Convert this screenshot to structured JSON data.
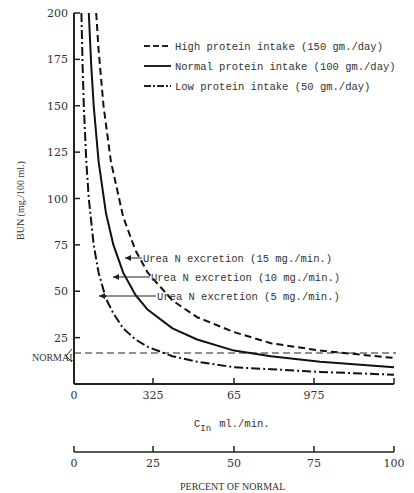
{
  "chart_data": {
    "type": "line",
    "title": "",
    "xlabel": "C_In ml./min.",
    "xlabel_main": "C",
    "xlabel_sub": "In",
    "xlabel_unit": "ml./min.",
    "x2label": "PERCENT OF NORMAL",
    "ylabel": "BUN (mg./100 ml.)",
    "ylim": [
      0,
      200
    ],
    "xlim": [
      0,
      130
    ],
    "yticks": [
      25,
      50,
      75,
      100,
      125,
      150,
      175,
      200
    ],
    "ytick_labels": [
      "25",
      "50",
      "75",
      "100",
      "125",
      "150",
      "175",
      "200"
    ],
    "xtick_labels": [
      "0",
      "325",
      "65",
      "975"
    ],
    "x2tick_labels": [
      "0",
      "25",
      "50",
      "75",
      "100"
    ],
    "normal_line": {
      "label": "NORMAL",
      "value": 16.5
    },
    "legend_position": "upper right",
    "series": [
      {
        "name": "High protein intake (150 gm./day)",
        "style": "dashed",
        "annotation": "Urea N excretion (15 mg./min.)",
        "x": [
          9,
          10,
          12,
          15,
          20,
          25,
          30,
          40,
          50,
          65,
          80,
          100,
          130
        ],
        "y": [
          200,
          180,
          150,
          120,
          90,
          72,
          60,
          45,
          36,
          28,
          22,
          18,
          14
        ]
      },
      {
        "name": "Normal protein intake (100 gm./day)",
        "style": "solid",
        "annotation": "Urea N excretion (10 mg./min.)",
        "x": [
          6,
          7,
          8,
          10,
          13,
          16,
          20,
          25,
          30,
          40,
          50,
          65,
          80,
          100,
          130
        ],
        "y": [
          200,
          172,
          150,
          120,
          92,
          75,
          60,
          48,
          40,
          30,
          24,
          18,
          15,
          12,
          9
        ]
      },
      {
        "name": "Low protein intake (50 gm./day)",
        "style": "dash-dot",
        "annotation": "Urea N excretion (5 mg./min.)",
        "x": [
          3,
          3.5,
          4,
          5,
          6,
          8,
          10,
          13,
          16,
          20,
          25,
          30,
          40,
          50,
          65,
          80,
          100,
          130
        ],
        "y": [
          200,
          172,
          150,
          120,
          100,
          75,
          60,
          46,
          38,
          30,
          24,
          20,
          15,
          12,
          9,
          8,
          6.5,
          5
        ]
      }
    ]
  },
  "legend": {
    "items": [
      {
        "label": "High protein intake  (150 gm./day)",
        "style": "dashed"
      },
      {
        "label": "Normal protein intake (100 gm./day)",
        "style": "solid"
      },
      {
        "label": "Low protein intake (50 gm./day)",
        "style": "dash-dot"
      }
    ]
  },
  "annotations": [
    {
      "label": "Urea N excretion  (15 mg./min.)"
    },
    {
      "label": "Urea N excretion (10 mg./min.)"
    },
    {
      "label": "Urea N excretion (5 mg./min.)"
    }
  ]
}
